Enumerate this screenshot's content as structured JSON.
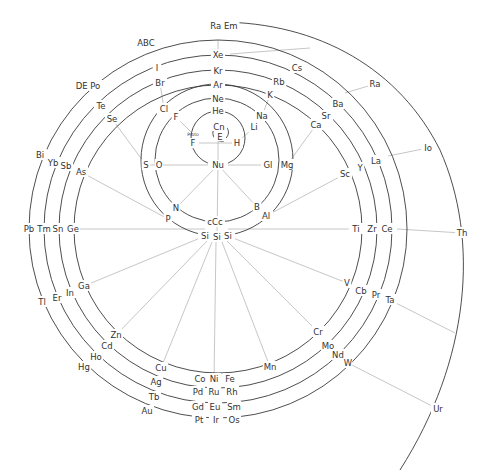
{
  "colors": {
    "arc": "#3a3a3a",
    "spoke": "#b8b8b8",
    "text": "#333333",
    "background": "#ffffff"
  },
  "center": {
    "x": 218,
    "y": 165
  },
  "inner": {
    "Cn": {
      "label": "Cn",
      "x": 219,
      "y": 127
    },
    "E": {
      "label": "E",
      "x": 220,
      "y": 137
    },
    "Proto": {
      "label": "Proto",
      "x": 193,
      "y": 134
    },
    "F_inner": {
      "label": "F",
      "x": 193,
      "y": 143
    },
    "H": {
      "label": "H",
      "x": 237,
      "y": 143
    },
    "Nu": {
      "label": "Nu",
      "x": 218,
      "y": 165
    }
  },
  "elements": [
    {
      "label": "He",
      "x": 218,
      "y": 111
    },
    {
      "label": "Li",
      "x": 254,
      "y": 127
    },
    {
      "label": "F",
      "x": 176,
      "y": 117
    },
    {
      "label": "Gl",
      "x": 268,
      "y": 165
    },
    {
      "label": "Mg",
      "x": 287,
      "y": 165
    },
    {
      "label": "O",
      "x": 159,
      "y": 165
    },
    {
      "label": "S",
      "x": 146,
      "y": 165
    },
    {
      "label": "N",
      "x": 176,
      "y": 208
    },
    {
      "label": "P",
      "x": 168,
      "y": 219
    },
    {
      "label": "B",
      "x": 257,
      "y": 207
    },
    {
      "label": "Al",
      "x": 266,
      "y": 216
    },
    {
      "label": "cCc",
      "x": 215,
      "y": 222
    },
    {
      "label": "Si",
      "x": 205,
      "y": 236
    },
    {
      "label": "Si",
      "x": 217,
      "y": 237
    },
    {
      "label": "Si",
      "x": 228,
      "y": 236
    },
    {
      "label": "Ne",
      "x": 218,
      "y": 99
    },
    {
      "label": "Na",
      "x": 262,
      "y": 116
    },
    {
      "label": "Cl",
      "x": 164,
      "y": 109
    },
    {
      "label": "Ar",
      "x": 218,
      "y": 85
    },
    {
      "label": "K",
      "x": 270,
      "y": 95
    },
    {
      "label": "Ca",
      "x": 316,
      "y": 125
    },
    {
      "label": "Sc",
      "x": 345,
      "y": 174
    },
    {
      "label": "Ti",
      "x": 356,
      "y": 229
    },
    {
      "label": "V",
      "x": 347,
      "y": 283
    },
    {
      "label": "Cr",
      "x": 318,
      "y": 332
    },
    {
      "label": "Mn",
      "x": 270,
      "y": 367
    },
    {
      "label": "Fe",
      "x": 230,
      "y": 379
    },
    {
      "label": "Ni",
      "x": 214,
      "y": 379
    },
    {
      "label": "Co",
      "x": 200,
      "y": 379
    },
    {
      "label": "Cu",
      "x": 161,
      "y": 368
    },
    {
      "label": "Zn",
      "x": 116,
      "y": 335
    },
    {
      "label": "Ga",
      "x": 84,
      "y": 286
    },
    {
      "label": "Ge",
      "x": 73,
      "y": 229
    },
    {
      "label": "As",
      "x": 81,
      "y": 172
    },
    {
      "label": "Se",
      "x": 112,
      "y": 119
    },
    {
      "label": "Br",
      "x": 160,
      "y": 83
    },
    {
      "label": "Kr",
      "x": 218,
      "y": 71
    },
    {
      "label": "Rb",
      "x": 279,
      "y": 82
    },
    {
      "label": "Sr",
      "x": 326,
      "y": 116
    },
    {
      "label": "Y",
      "x": 360,
      "y": 168
    },
    {
      "label": "Zr",
      "x": 372,
      "y": 229
    },
    {
      "label": "Cb",
      "x": 361,
      "y": 291
    },
    {
      "label": "Mo",
      "x": 328,
      "y": 346
    },
    {
      "label": "Ru",
      "x": 214,
      "y": 392
    },
    {
      "label": "Rh",
      "x": 232,
      "y": 392
    },
    {
      "label": "Pd",
      "x": 198,
      "y": 392
    },
    {
      "label": "Ag",
      "x": 156,
      "y": 382
    },
    {
      "label": "Cd",
      "x": 107,
      "y": 346
    },
    {
      "label": "In",
      "x": 70,
      "y": 293
    },
    {
      "label": "Sn",
      "x": 58,
      "y": 229
    },
    {
      "label": "Sb",
      "x": 66,
      "y": 166
    },
    {
      "label": "Te",
      "x": 101,
      "y": 106
    },
    {
      "label": "I",
      "x": 157,
      "y": 68
    },
    {
      "label": "Xe",
      "x": 218,
      "y": 55
    },
    {
      "label": "Cs",
      "x": 297,
      "y": 68
    },
    {
      "label": "Ba",
      "x": 338,
      "y": 104
    },
    {
      "label": "La",
      "x": 376,
      "y": 161
    },
    {
      "label": "Ce",
      "x": 387,
      "y": 229
    },
    {
      "label": "Pr",
      "x": 376,
      "y": 295
    },
    {
      "label": "Nd",
      "x": 338,
      "y": 355
    },
    {
      "label": "Sm",
      "x": 234,
      "y": 407
    },
    {
      "label": "Eu",
      "x": 215,
      "y": 407
    },
    {
      "label": "Gd",
      "x": 198,
      "y": 407
    },
    {
      "label": "Tb",
      "x": 154,
      "y": 397
    },
    {
      "label": "Ho",
      "x": 96,
      "y": 357
    },
    {
      "label": "Er",
      "x": 57,
      "y": 298
    },
    {
      "label": "Tm",
      "x": 44,
      "y": 229
    },
    {
      "label": "Yb",
      "x": 53,
      "y": 163
    },
    {
      "label": "Ra Em",
      "x": 224,
      "y": 26
    },
    {
      "label": "ABC",
      "x": 146,
      "y": 43
    },
    {
      "label": "DE Po",
      "x": 88,
      "y": 86
    },
    {
      "label": "Bi",
      "x": 40,
      "y": 155
    },
    {
      "label": "Pb",
      "x": 29,
      "y": 229
    },
    {
      "label": "Tl",
      "x": 42,
      "y": 302
    },
    {
      "label": "Hg",
      "x": 84,
      "y": 367
    },
    {
      "label": "Au",
      "x": 147,
      "y": 411
    },
    {
      "label": "Pt",
      "x": 199,
      "y": 420
    },
    {
      "label": "Ir",
      "x": 216,
      "y": 420
    },
    {
      "label": "Os",
      "x": 234,
      "y": 420
    },
    {
      "label": "W",
      "x": 348,
      "y": 363
    },
    {
      "label": "Ta",
      "x": 390,
      "y": 300
    },
    {
      "label": "Ra",
      "x": 375,
      "y": 84
    },
    {
      "label": "Io",
      "x": 428,
      "y": 148
    },
    {
      "label": "Th",
      "x": 462,
      "y": 233
    },
    {
      "label": "Ur",
      "x": 438,
      "y": 409
    }
  ]
}
